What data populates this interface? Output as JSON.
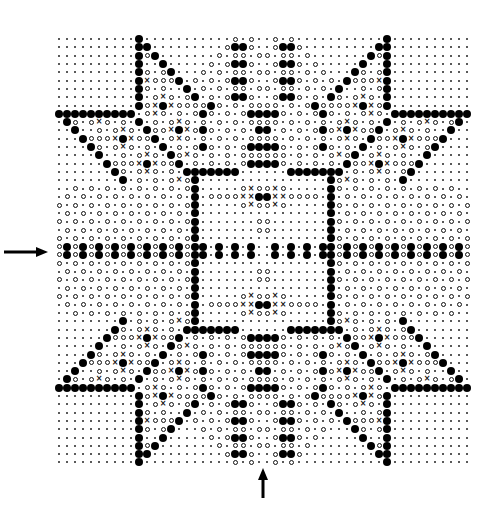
{
  "chart": {
    "title": "",
    "cols": 52,
    "rows": 52,
    "legend": {
      ".": "dot",
      "o": "open-circle",
      "#": "filled-circle",
      "x": "cross"
    },
    "quadrant_top_left": [
      "..........#...........o.o.",
      "..........##.........o##o.",
      "..........#o#.......o.oo.o",
      "..........#..#.....o.o##o.",
      "..........#o.o#...o.o.oo.o",
      "..........#xooo#.o.o.o##o.",
      "..........#o.o..#.o.o.oo.o",
      "..........#.oxo.o#.o.o##o.",
      "..........#ox#xoooo#o.o.oo",
      "##########.oxo.o.o#o.o.o##",
      ".#o.oxo.o.#.o.oxo.o.o.o.oo",
      "..#..o.oxo.#oox#xo#o.o.o.#",
      "...#ooox#xoo#.oxo.o.o.o.oo",
      "....#o.oxo.o.#.o.o#o.o.o##",
      ".....#..o.oxo.#oxo.o.o.ooo",
      "......#ooox#xoo#.o.o.o.o##",
      ".......#o.oxo.o.#######...",
      "........#.o.o.oxo#........",
      "..o.o.o.o.o.o.o.o#.....oxo",
      ".o.o.o.o.o.o.o.o.#.ooooxx#",
      "o.o.o.o.o.o.o.o.o#.....oxo",
      ".o.o.o.o.o.o.o.o.#........",
      "o.o.o.o.o.o.o.o.o#.......o",
      ".o.o.o.o.o.o.o.o.#.......o",
      "o.o.o.o.o.o.o.o.o#........",
      "o#o#o#o#o#o#o#o#o##.#.#.#."
    ]
  },
  "arrows": {
    "left": "row-marker-arrow",
    "bottom": "column-marker-arrow"
  }
}
